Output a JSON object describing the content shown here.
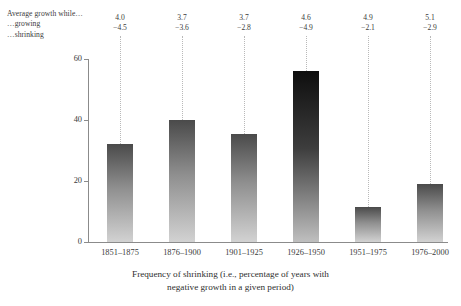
{
  "annotation": {
    "head": "Average growth while…",
    "growing_label": "…growing",
    "shrinking_label": "…shrinking"
  },
  "axes": {
    "yticks": [
      "0",
      "20",
      "40",
      "60"
    ],
    "ymin": 0,
    "ymax": 60
  },
  "caption": {
    "line1": "Frequency of shrinking (i.e., percentage of years with",
    "line2": "negative growth in a given period)"
  },
  "colors": {
    "bar_top": "#4a4a4a",
    "bar_bottom": "#d2d2d2",
    "bar_top_dark": "#0e0e0e",
    "axis": "#8b8b8b",
    "leader": "#b9b9b9",
    "text": "#3b3b3b"
  },
  "chart_data": {
    "type": "bar",
    "title": "",
    "xlabel": "Frequency of shrinking (i.e., percentage of years with negative growth in a given period)",
    "ylabel": "",
    "categories": [
      "1851–1875",
      "1876–1900",
      "1901–1925",
      "1926–1950",
      "1951–1975",
      "1976–2000"
    ],
    "values": [
      32,
      40,
      35.5,
      56,
      11.5,
      19
    ],
    "ylim": [
      0,
      60
    ],
    "yticks": [
      0,
      20,
      40,
      60
    ],
    "grid": false,
    "legend": "none",
    "annotations": {
      "growing": [
        4.0,
        3.7,
        3.7,
        4.6,
        4.9,
        5.1
      ],
      "shrinking": [
        -4.5,
        -3.6,
        -2.8,
        -4.9,
        -2.1,
        -2.9
      ]
    },
    "labels": [
      {
        "category": "1851–1875",
        "value": 32,
        "growing": "4.0",
        "shrinking": "−4.5"
      },
      {
        "category": "1876–1900",
        "value": 40,
        "growing": "3.7",
        "shrinking": "−3.6"
      },
      {
        "category": "1901–1925",
        "value": 35.5,
        "growing": "3.7",
        "shrinking": "−2.8"
      },
      {
        "category": "1926–1950",
        "value": 56,
        "growing": "4.6",
        "shrinking": "−4.9"
      },
      {
        "category": "1951–1975",
        "value": 11.5,
        "growing": "4.9",
        "shrinking": "−2.1"
      },
      {
        "category": "1976–2000",
        "value": 19,
        "growing": "5.1",
        "shrinking": "−2.9"
      }
    ]
  }
}
